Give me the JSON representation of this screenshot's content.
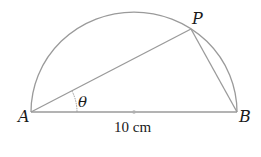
{
  "diagram": {
    "points": {
      "A": {
        "label": "A"
      },
      "B": {
        "label": "B"
      },
      "P": {
        "label": "P"
      }
    },
    "angle_label": "θ",
    "measurement": "10 cm",
    "colors": {
      "stroke": "#9a9a9a",
      "text": "#1a1a1a",
      "background": "#ffffff"
    }
  }
}
